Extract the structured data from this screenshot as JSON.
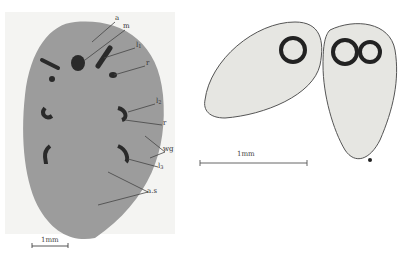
{
  "figure": {
    "left_panel": {
      "description": "ventral view of oval specimen",
      "labels": [
        {
          "id": "a",
          "text": "a",
          "sub": ""
        },
        {
          "id": "m",
          "text": "m",
          "sub": ""
        },
        {
          "id": "l1",
          "text": "l",
          "sub": "1"
        },
        {
          "id": "r1",
          "text": "r",
          "sub": ""
        },
        {
          "id": "l2",
          "text": "l",
          "sub": "2"
        },
        {
          "id": "r2",
          "text": "r",
          "sub": ""
        },
        {
          "id": "wg",
          "text": "wg",
          "sub": ""
        },
        {
          "id": "l3",
          "text": "l",
          "sub": "3"
        },
        {
          "id": "as",
          "text": "a.s",
          "sub": ""
        }
      ],
      "scale_bar": {
        "label": "1mm"
      }
    },
    "right_panel": {
      "description": "two translucent eggs/embryos with dark ring eyespots",
      "scale_bar": {
        "label": "1mm"
      }
    },
    "colors": {
      "body_gray": "#9a9a9a",
      "dark_marks": "#2a2a2a",
      "translucent_fill": "#e6e6e2",
      "outline": "#555555"
    }
  }
}
